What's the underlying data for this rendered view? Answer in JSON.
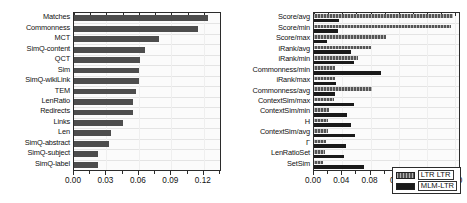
{
  "chart_data": [
    {
      "id": "left",
      "type": "bar",
      "title": "",
      "xlabel": "",
      "ylabel": "",
      "orientation": "horizontal",
      "xlim": [
        0.0,
        0.135
      ],
      "grid": true,
      "legend": null,
      "tick_labels": [
        "0.00",
        "0.03",
        "0.06",
        "0.09",
        "0.12"
      ],
      "tick_values": [
        0.0,
        0.03,
        0.06,
        0.09,
        0.12
      ],
      "categories": [
        "Matches",
        "Commonness",
        "MCT",
        "SimQ-content",
        "QCT",
        "Sim",
        "SimQ-wikiLink",
        "TEM",
        "LenRatio",
        "Redirects",
        "Links",
        "Len",
        "SimQ-abstract",
        "SimQ-subject",
        "SimQ-label"
      ],
      "values": [
        0.124,
        0.115,
        0.079,
        0.066,
        0.061,
        0.06,
        0.06,
        0.057,
        0.055,
        0.055,
        0.045,
        0.034,
        0.032,
        0.022,
        0.022
      ],
      "series_color": "#4d4d4d"
    },
    {
      "id": "right",
      "type": "bar",
      "title": "",
      "xlabel": "",
      "ylabel": "",
      "orientation": "horizontal",
      "xlim": [
        0.0,
        0.205
      ],
      "grid": true,
      "legend_position": "bottom-right",
      "tick_labels": [
        "0.00",
        "0.04",
        "0.08",
        "0.12",
        "0.16",
        "0.20"
      ],
      "tick_values": [
        0.0,
        0.04,
        0.08,
        0.12,
        0.16,
        0.2
      ],
      "categories": [
        "Score/avg",
        "Score/min",
        "Score/max",
        "iRank/avg",
        "iRank/min",
        "Commonness/min",
        "iRank/max",
        "Commonness/avg",
        "ContextSim/max",
        "ContextSim/min",
        "H",
        "ContextSim/avg",
        "Γ",
        "LenRatioSet",
        "SetSim"
      ],
      "series": [
        {
          "name": "LTR LTR",
          "color": "#555555",
          "values": [
            0.196,
            0.193,
            0.102,
            0.08,
            0.062,
            0.03,
            0.03,
            0.082,
            0.028,
            0.021,
            0.02,
            0.02,
            0.017,
            0.015,
            0.013
          ]
        },
        {
          "name": "MLM-LTR",
          "color": "#1a1a1a",
          "values": [
            0.035,
            0.034,
            0.019,
            0.052,
            0.057,
            0.095,
            0.031,
            0.029,
            0.057,
            0.046,
            0.053,
            0.058,
            0.045,
            0.043,
            0.07
          ]
        }
      ]
    }
  ],
  "legend": {
    "items": [
      {
        "label": "LTR LTR",
        "color": "#555555"
      },
      {
        "label": "MLM-LTR",
        "color": "#1a1a1a"
      }
    ]
  }
}
